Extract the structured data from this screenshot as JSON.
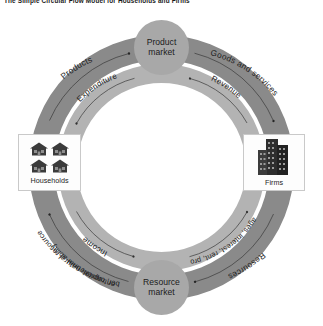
{
  "title": "The Simple Circular Flow Model for Households and Firms",
  "diagram": {
    "type": "circular-flow",
    "markets": {
      "top": "Product market",
      "bottom": "Resource market"
    },
    "entities": {
      "left": {
        "label": "Households",
        "icon": "houses-icon"
      },
      "right": {
        "label": "Firms",
        "icon": "buildings-icon"
      }
    },
    "outer_ring": {
      "color": "#8a8a8a",
      "flow": "clockwise",
      "labels": {
        "upper_left": "Products",
        "upper_right": "Goods and services",
        "lower_right": "Resources",
        "lower_left_line1": "Labor, capital, natural resources,",
        "lower_left_line2": "entrepreneurial ability"
      }
    },
    "inner_ring": {
      "color": "#b3b3b3",
      "flow": "counter-clockwise",
      "labels": {
        "upper_left": "Expenditure",
        "upper_right": "Revenue",
        "lower_right": "Wages, interest, rent, profit",
        "lower_left": "Income"
      }
    }
  }
}
